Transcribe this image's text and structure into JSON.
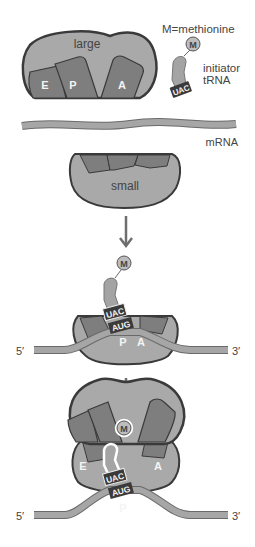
{
  "colors": {
    "subunit_fill": "#a9a9a9",
    "subunit_stroke": "#3a3a3a",
    "site_fill": "#7e7e7e",
    "trna_fill": "#a4a4a4",
    "mrna_fill": "#a6a6a6",
    "codon_bg": "#3a3a3a",
    "arrow": "#6e6e6e",
    "text": "#444444"
  },
  "panel1": {
    "large_subunit_label": "large",
    "sites": [
      "E",
      "P",
      "A"
    ],
    "legend": "M=methionine",
    "methionine": "M",
    "trna_label_line1": "initiator",
    "trna_label_line2": "tRNA",
    "anticodon": "UAC",
    "mrna_label": "mRNA",
    "small_subunit_label": "small"
  },
  "panel2": {
    "methionine": "M",
    "anticodon": "UAC",
    "codon": "AUG",
    "sites": [
      "P",
      "A"
    ],
    "five_prime": "5′",
    "three_prime": "3′"
  },
  "panel3": {
    "methionine": "M",
    "anticodon": "UAC",
    "codon": "AUG",
    "sites": [
      "E",
      "A",
      "P"
    ],
    "five_prime": "5′",
    "three_prime": "3′"
  }
}
